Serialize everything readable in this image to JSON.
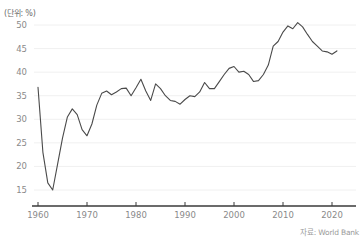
{
  "unit_label": "(단위: %)",
  "source_label": "자료: World Bank",
  "axis_color": "#3a3a3a",
  "grid_color": "#f0f0f0",
  "line_color": "#4a4a4a",
  "tick_text_color": "#8a8a8a",
  "chart_data": {
    "type": "line",
    "title": "",
    "subtitle": "",
    "xlabel": "",
    "ylabel": "",
    "unit": "%",
    "source": "자료: World Bank",
    "grid": true,
    "legend": "none",
    "xlim": [
      1960,
      2021
    ],
    "ylim": [
      13,
      52
    ],
    "yticks": [
      15,
      20,
      25,
      30,
      35,
      40,
      45,
      50
    ],
    "xticks": [
      1960,
      1970,
      1980,
      1990,
      2000,
      2010,
      2020
    ],
    "series": [
      {
        "name": "비율",
        "x": [
          1960,
          1961,
          1962,
          1963,
          1964,
          1965,
          1966,
          1967,
          1968,
          1969,
          1970,
          1971,
          1972,
          1973,
          1974,
          1975,
          1976,
          1977,
          1978,
          1979,
          1980,
          1981,
          1982,
          1983,
          1984,
          1985,
          1986,
          1987,
          1988,
          1989,
          1990,
          1991,
          1992,
          1993,
          1994,
          1995,
          1996,
          1997,
          1998,
          1999,
          2000,
          2001,
          2002,
          2003,
          2004,
          2005,
          2006,
          2007,
          2008,
          2009,
          2010,
          2011,
          2012,
          2013,
          2014,
          2015,
          2016,
          2017,
          2018,
          2019,
          2020,
          2021
        ],
        "values": [
          36.8,
          23.0,
          16.5,
          15.0,
          20.5,
          26.0,
          30.5,
          32.2,
          31.0,
          27.8,
          26.5,
          29.0,
          33.0,
          35.5,
          36.0,
          35.2,
          35.8,
          36.5,
          36.6,
          35.0,
          36.7,
          38.5,
          36.0,
          34.0,
          37.5,
          36.5,
          35.0,
          34.0,
          33.8,
          33.2,
          34.2,
          35.0,
          34.8,
          35.8,
          37.8,
          36.5,
          36.5,
          38.0,
          39.5,
          40.8,
          41.2,
          40.0,
          40.2,
          39.5,
          38.0,
          38.2,
          39.5,
          41.5,
          45.5,
          46.5,
          48.5,
          49.8,
          49.2,
          50.5,
          49.6,
          48.0,
          46.5,
          45.5,
          44.5,
          44.3,
          43.8,
          44.5
        ]
      }
    ]
  }
}
